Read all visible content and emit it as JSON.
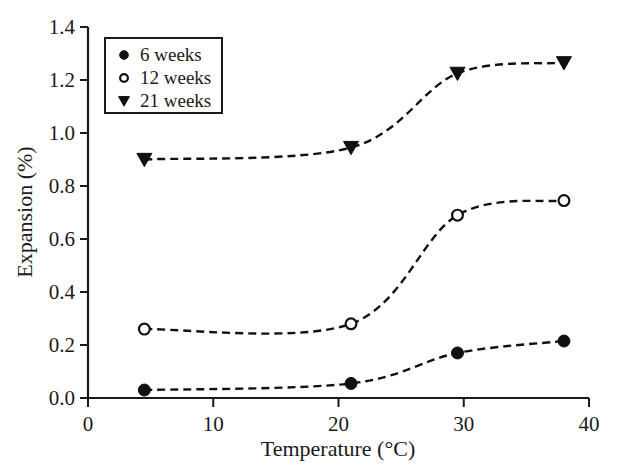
{
  "chart_data": {
    "type": "line",
    "title": "",
    "xlabel": "Temperature (°C)",
    "ylabel": "Expansion (%)",
    "xlim": [
      0,
      40
    ],
    "ylim": [
      0.0,
      1.4
    ],
    "xticks": [
      0,
      10,
      20,
      30,
      40
    ],
    "xtick_labels": [
      "0",
      "10",
      "20",
      "30",
      "40"
    ],
    "yticks": [
      0.0,
      0.2,
      0.4,
      0.6,
      0.8,
      1.0,
      1.2,
      1.4
    ],
    "ytick_labels": [
      "0.0",
      "0.2",
      "0.4",
      "0.6",
      "0.8",
      "1.0",
      "1.2",
      "1.4"
    ],
    "grid": false,
    "legend_position": "upper left",
    "linestyle": "dashed",
    "x": [
      4.5,
      21.0,
      29.5,
      38.0
    ],
    "series": [
      {
        "name": "6 weeks",
        "marker": "filled-circle",
        "values": [
          0.03,
          0.055,
          0.17,
          0.215
        ]
      },
      {
        "name": "12 weeks",
        "marker": "open-circle",
        "values": [
          0.26,
          0.28,
          0.69,
          0.745
        ]
      },
      {
        "name": "21 weeks",
        "marker": "filled-triangle-down",
        "values": [
          0.9,
          0.945,
          1.225,
          1.265
        ]
      }
    ],
    "colors": {
      "line": "#111111",
      "axis": "#1a1a1a",
      "text": "#1a1a1a",
      "background": "#ffffff"
    }
  },
  "legend": {
    "entries": [
      {
        "label": "6 weeks",
        "marker": "filled-circle"
      },
      {
        "label": "12 weeks",
        "marker": "open-circle"
      },
      {
        "label": "21 weeks",
        "marker": "filled-triangle-down"
      }
    ]
  },
  "axes": {
    "x_title": "Temperature (°C)",
    "y_title": "Expansion (%)"
  }
}
